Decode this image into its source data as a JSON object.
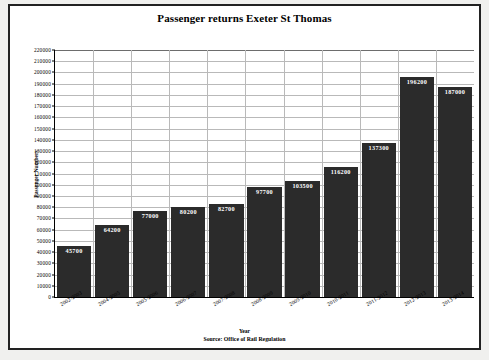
{
  "chart_data": {
    "type": "bar",
    "title": "Passenger returns Exeter St Thomas",
    "xlabel": "Year",
    "ylabel": "Passenger Numbers",
    "source": "Source: Office of Rail Regulation",
    "categories": [
      "2002-2003",
      "2004-2005",
      "2005-2006",
      "2006-2007",
      "2007-2008",
      "2008-2009",
      "2009-2010",
      "2010-2011",
      "2011-2012",
      "2012-2013",
      "2013-2014"
    ],
    "values": [
      45700,
      64200,
      77000,
      80200,
      82700,
      97700,
      103500,
      116200,
      137300,
      196200,
      187000
    ],
    "value_labels": [
      "45700",
      "64200",
      "77000",
      "80200",
      "82700",
      "97700",
      "103500",
      "116200",
      "137300",
      "196200",
      "187000"
    ],
    "ylim": [
      0,
      220000
    ],
    "ytick_step": 10000,
    "yticks": [
      "220000",
      "210000",
      "200000",
      "190000",
      "180000",
      "170000",
      "160000",
      "150000",
      "140000",
      "130000",
      "120000",
      "110000",
      "100000",
      "90000",
      "80000",
      "70000",
      "60000",
      "50000",
      "40000",
      "30000",
      "20000",
      "10000",
      "0"
    ],
    "grid": true,
    "legend": false,
    "bar_color": "#2b2b2b",
    "label_color": "#ffffff",
    "grid_color": "#b9b9b9",
    "background": "#ffffff",
    "border_color": "#222222"
  }
}
